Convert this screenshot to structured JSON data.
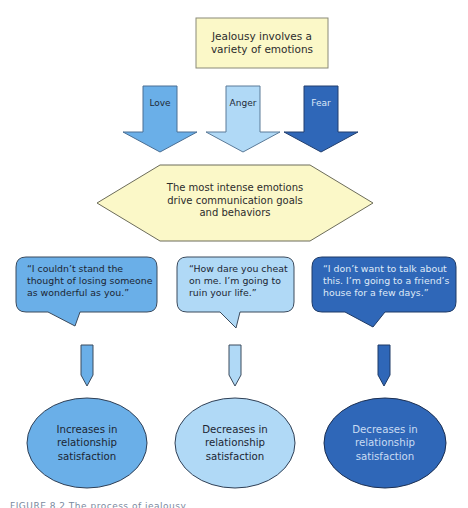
{
  "diagram": {
    "title_box": {
      "text": "Jealousy involves a variety of emotions",
      "lines": [
        "Jealousy involves a",
        "variety of emotions"
      ]
    },
    "emotions": [
      {
        "label": "Love",
        "color": "#6aafe8"
      },
      {
        "label": "Anger",
        "color": "#b0d9f6"
      },
      {
        "label": "Fear",
        "color": "#2f67b8"
      }
    ],
    "hexagon": {
      "lines": [
        "The most intense emotions",
        "drive communication goals",
        "and behaviors"
      ]
    },
    "speech_bubbles": [
      {
        "emotion": "Love",
        "lines": [
          "“I couldn’t stand the",
          "thought of losing someone",
          "as wonderful as you.”"
        ]
      },
      {
        "emotion": "Anger",
        "lines": [
          "“How dare you cheat",
          "on me. I’m going to",
          "ruin your life.”"
        ]
      },
      {
        "emotion": "Fear",
        "lines": [
          "“I don’t want to talk about",
          "this. I’m going to a friend’s",
          "house for a few days.”"
        ]
      }
    ],
    "outcomes": [
      {
        "emotion": "Love",
        "lines": [
          "Increases in",
          "relationship",
          "satisfaction"
        ]
      },
      {
        "emotion": "Anger",
        "lines": [
          "Decreases in",
          "relationship",
          "satisfaction"
        ]
      },
      {
        "emotion": "Fear",
        "lines": [
          "Decreases in",
          "relationship",
          "satisfaction"
        ]
      }
    ],
    "caption_partial": "FIGURE 8.2  The process of jealousy expression"
  },
  "colors": {
    "pale_yellow": "#fbf8c8",
    "love_blue": "#6aafe8",
    "anger_blue": "#b0d9f6",
    "fear_blue": "#2f67b8",
    "outline": "#3b4a5c",
    "dark_text": "#2c2c2c",
    "light_text_on_dark": "#d8e6f7"
  }
}
